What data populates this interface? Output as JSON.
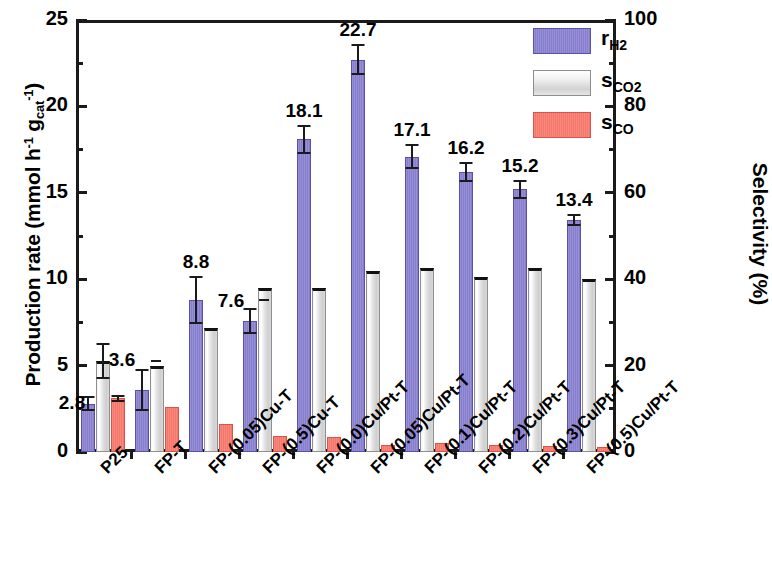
{
  "chart_data": {
    "type": "bar",
    "title": "",
    "xlabel": "",
    "ylabel": "Production rate (mmol h⁻¹ gₑₐₜ⁻¹)",
    "ylabel_main": "Production rate (mmol h",
    "ylabel_sup1": "-1",
    "ylabel_mid": " g",
    "ylabel_sub": "cat",
    "ylabel_sup2": "-1",
    "ylabel_end": ")",
    "y2label": "Selectivity (%)",
    "ylim": [
      0,
      25
    ],
    "y2lim": [
      0,
      100
    ],
    "y_ticks": [
      "0",
      "5",
      "10",
      "15",
      "20",
      "25"
    ],
    "y_tick_values": [
      0,
      5,
      10,
      15,
      20,
      25
    ],
    "y_minor_step": 2.5,
    "y2_ticks": [
      "0",
      "20",
      "40",
      "60",
      "80",
      "100"
    ],
    "y2_tick_values": [
      0,
      20,
      40,
      60,
      80,
      100
    ],
    "y2_minor_step": 10,
    "grid": false,
    "legend_position": "top-right",
    "categories": [
      "P25",
      "FP-T",
      "FP-(0.05)Cu-T",
      "FP-(0.5)Cu-T",
      "FP-(0.0)Cu/Pt-T",
      "FP-(0.05)Cu/Pt-T",
      "FP-(0.1)Cu/Pt-T",
      "FP-(0.2)Cu/Pt-T",
      "FP-(0.3)Cu/Pt-T",
      "FP-(0.5)Cu/Pt-T"
    ],
    "series": [
      {
        "name": "rH2",
        "legend_main": "r",
        "legend_sub": "H2",
        "axis": "left",
        "unit": "mmol h-1 gcat-1",
        "color": "#8b82d2",
        "values": [
          2.8,
          3.6,
          8.8,
          7.6,
          18.1,
          22.7,
          17.1,
          16.2,
          15.2,
          13.4
        ],
        "data_labels": [
          "2.8",
          "3.6",
          "8.8",
          "7.6",
          "18.1",
          "22.7",
          "17.1",
          "16.2",
          "15.2",
          "13.4"
        ],
        "errors": [
          0.45,
          1.2,
          1.4,
          0.75,
          0.85,
          0.9,
          0.7,
          0.6,
          0.55,
          0.35
        ]
      },
      {
        "name": "sCO2",
        "legend_main": "s",
        "legend_sub": "CO2",
        "axis": "right",
        "unit": "%",
        "color": "#e2e2e2",
        "values_percent": [
          21.0,
          20.0,
          28.5,
          38.0,
          38.0,
          42.0,
          42.5,
          40.5,
          42.5,
          40.0
        ],
        "values_left_axis": [
          5.25,
          5.0,
          7.15,
          9.5,
          9.5,
          10.5,
          10.65,
          10.15,
          10.65,
          10.0
        ],
        "errors_percent": [
          4.2,
          0,
          0,
          0,
          0,
          0,
          0,
          0,
          0,
          0
        ]
      },
      {
        "name": "sCO",
        "legend_main": "s",
        "legend_sub": "CO",
        "axis": "right",
        "unit": "%",
        "color": "#fa7a6d",
        "values_percent": [
          12.4,
          10.4,
          6.6,
          3.6,
          3.4,
          1.5,
          2.0,
          1.6,
          1.3,
          1.1
        ],
        "values_left_axis": [
          3.1,
          2.6,
          1.65,
          0.9,
          0.85,
          0.38,
          0.5,
          0.4,
          0.33,
          0.28
        ],
        "errors_percent": [
          0.9,
          0,
          0,
          0,
          0,
          0,
          0,
          0,
          0,
          0
        ]
      }
    ],
    "colors": {
      "rH2": "#8b82d2",
      "sCO2": "#e2e2e2",
      "sCO": "#fa7a6d",
      "axis": "#1a1a1a",
      "background": "#ffffff"
    }
  }
}
